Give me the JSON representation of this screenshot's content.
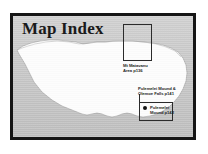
{
  "plate": {
    "title": "Map Index",
    "background_color": "#c4c4c4",
    "frame_color": "#151515",
    "land_color": "#ffffff"
  },
  "insets": [
    {
      "id": "matavanu",
      "label": "Mt Matavanu\nArea p136",
      "page": "p136",
      "name": "Mt Matavanu Area"
    },
    {
      "id": "pulemelei",
      "label": "Pulemelei Mound &\nOlemoe Falls p141",
      "page": "p141",
      "name": "Pulemelei Mound & Olemoe Falls"
    }
  ],
  "site_marker": {
    "label": "Pulemelei\nMound p142",
    "page": "p142",
    "name": "Pulemelei Mound",
    "marker": "filled-dot"
  }
}
